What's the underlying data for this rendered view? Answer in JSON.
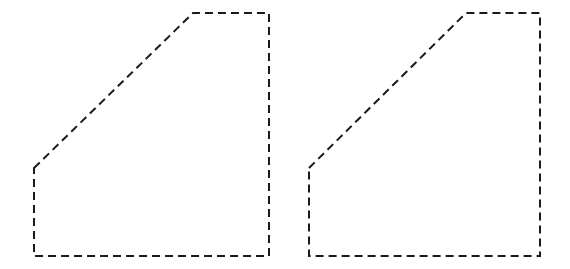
{
  "canvas": {
    "width": 570,
    "height": 269,
    "background_color": "#ffffff"
  },
  "figure": {
    "shape_count": 2
  },
  "style": {
    "stroke_color": "#1a1a1a",
    "stroke_width": 2,
    "fill": "none",
    "dash_length": 8,
    "dash_gap": 5,
    "dash_array": "8 5"
  },
  "shapes": [
    {
      "id": "shape-left",
      "label": "Left pentagon",
      "sides": 5,
      "points": "34,168 193,13 269,13 269,256 34,256",
      "vertices": [
        {
          "name": "diagonal-bottom",
          "x": 34,
          "y": 168
        },
        {
          "name": "diagonal-top",
          "x": 193,
          "y": 13
        },
        {
          "name": "top-right",
          "x": 269,
          "y": 13
        },
        {
          "name": "bottom-right",
          "x": 269,
          "y": 256
        },
        {
          "name": "bottom-left",
          "x": 34,
          "y": 256
        }
      ],
      "bounds": {
        "x": 34,
        "y": 13,
        "width": 235,
        "height": 243
      }
    },
    {
      "id": "shape-right",
      "label": "Right pentagon",
      "sides": 5,
      "points": "309,168 466,13 540,13 540,256 309,256",
      "vertices": [
        {
          "name": "diagonal-bottom",
          "x": 309,
          "y": 168
        },
        {
          "name": "diagonal-top",
          "x": 466,
          "y": 13
        },
        {
          "name": "top-right",
          "x": 540,
          "y": 13
        },
        {
          "name": "bottom-right",
          "x": 540,
          "y": 256
        },
        {
          "name": "bottom-left",
          "x": 309,
          "y": 256
        }
      ],
      "bounds": {
        "x": 309,
        "y": 13,
        "width": 231,
        "height": 243
      }
    }
  ]
}
